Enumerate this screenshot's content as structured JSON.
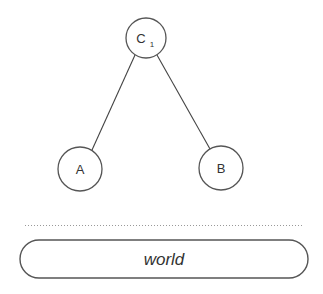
{
  "diagram": {
    "type": "tree",
    "nodes": [
      {
        "id": "C1",
        "label": "C",
        "subscript": "1",
        "cx": 146,
        "cy": 38,
        "r": 20
      },
      {
        "id": "A",
        "label": "A",
        "cx": 80,
        "cy": 169,
        "r": 22
      },
      {
        "id": "B",
        "label": "B",
        "cx": 221,
        "cy": 168,
        "r": 22
      }
    ],
    "edges": [
      {
        "from": "C1",
        "to": "A"
      },
      {
        "from": "C1",
        "to": "B"
      }
    ],
    "separator": {
      "style": "dotted"
    },
    "world": {
      "label": "world"
    }
  }
}
